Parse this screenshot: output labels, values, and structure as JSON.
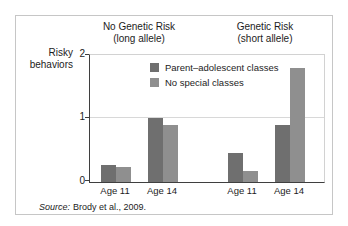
{
  "figure": {
    "source_prefix": "Source:",
    "source_rest": "Brody et al., 2009."
  },
  "chart_data": {
    "type": "bar",
    "title": "",
    "group_titles": [
      {
        "line1": "No Genetic Risk",
        "line2": "(long allele)"
      },
      {
        "line1": "Genetic Risk",
        "line2": "(short allele)"
      }
    ],
    "ylabel_lines": [
      "Risky",
      "behaviors"
    ],
    "y_tick_labels": [
      "0",
      "1",
      "2"
    ],
    "ylim": [
      0,
      2
    ],
    "grid": "horizontal gridlines at 1 and 2",
    "legend_position": "inside-top-center",
    "categories": [
      "Age 11",
      "Age 14",
      "Age 11",
      "Age 14"
    ],
    "category_groups": [
      "No Genetic Risk (long allele)",
      "No Genetic Risk (long allele)",
      "Genetic Risk (short allele)",
      "Genetic Risk (short allele)"
    ],
    "series": [
      {
        "name": "Parent–adolescent classes",
        "color": "#6f6f6f",
        "values": [
          0.27,
          1.0,
          0.45,
          0.9
        ]
      },
      {
        "name": "No special classes",
        "color": "#8f8f8f",
        "values": [
          0.23,
          0.9,
          0.17,
          1.8
        ]
      }
    ]
  }
}
